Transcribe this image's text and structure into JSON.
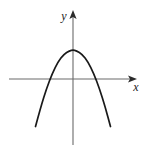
{
  "figure": {
    "width": 146,
    "height": 149,
    "background_color": "#ffffff",
    "curve_color": "#1a1a1a",
    "axis_color": "#6b6b6b",
    "label_color": "#1a1a1a"
  },
  "axes": {
    "x_axis": {
      "label": "x",
      "label_x": 136,
      "label_y": 91,
      "start_x": 9,
      "end_x": 137,
      "y": 79,
      "arrow": "right"
    },
    "y_axis": {
      "label": "y",
      "label_x": 64,
      "label_y": 20,
      "x": 73,
      "start_y": 145,
      "end_y": 10,
      "arrow": "up"
    },
    "origin": {
      "x": 73,
      "y": 79
    }
  },
  "chart_data": {
    "type": "line",
    "title": "",
    "xlabel": "x",
    "ylabel": "y",
    "grid": false,
    "legend": null,
    "axis_arrows": true,
    "curve_name": "parabola",
    "shape": "upward-opening parabola",
    "vertex": {
      "x": 0,
      "y": -1.3
    },
    "x_intercepts": [
      -0.96,
      1.0
    ],
    "y_intercept": -1.3,
    "xlim": [
      -1.67,
      1.67
    ],
    "ylim": [
      -1.9,
      1.85
    ],
    "pixel_vertex": {
      "x": 73,
      "y": 108
    },
    "pixel_x_intercepts": [
      52,
      96
    ],
    "pixel_endpoints": [
      {
        "x": 36,
        "y": 36
      },
      {
        "x": 110,
        "y": 37
      }
    ],
    "x": [
      -1.63,
      -1.4,
      -1.15,
      -0.9,
      -0.65,
      -0.4,
      -0.15,
      0.0,
      0.15,
      0.4,
      0.65,
      0.9,
      1.15,
      1.4,
      1.63
    ],
    "y": [
      2.13,
      1.25,
      0.43,
      -0.25,
      -0.77,
      -1.11,
      -1.27,
      -1.3,
      -1.27,
      -1.11,
      -0.77,
      -0.25,
      0.43,
      1.25,
      2.13
    ],
    "path_d": "M 36,36 C 45,60 52,79 60,95 C 65,105 69,108 73,108 C 77,108 82,104 87,94 C 95,79 102,59 110,37"
  }
}
